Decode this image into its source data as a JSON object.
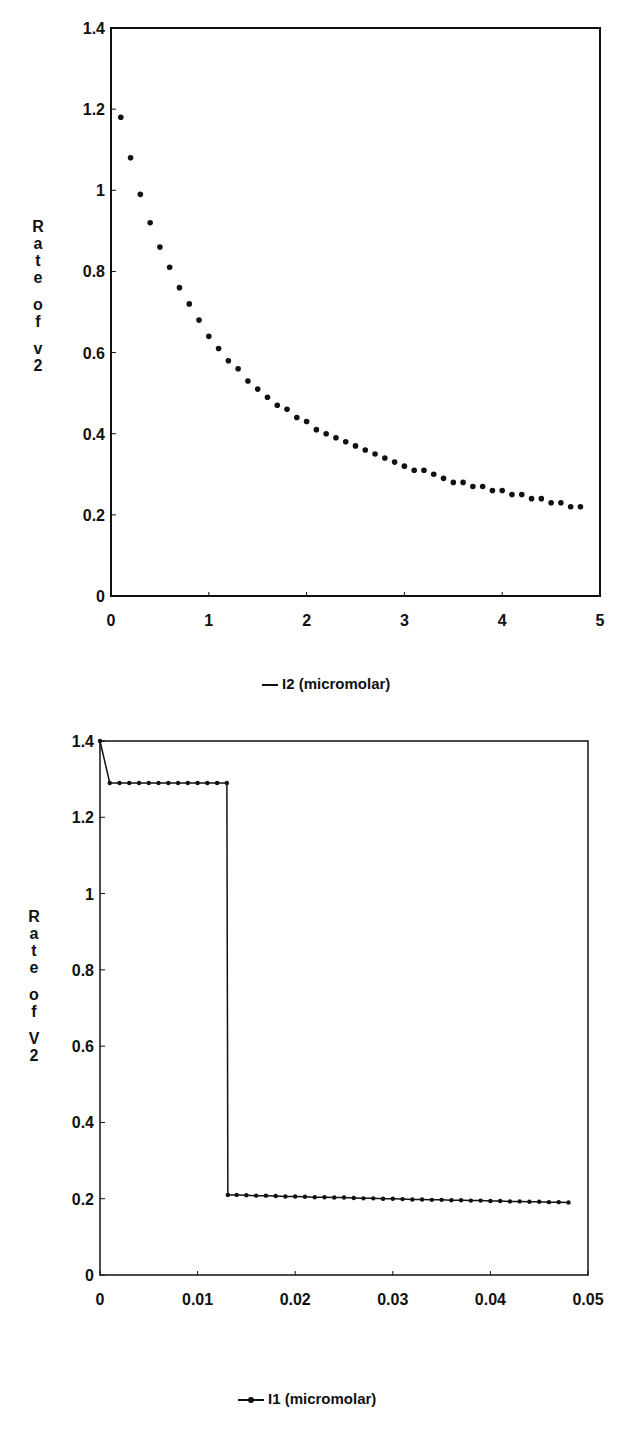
{
  "chart_data": [
    {
      "type": "scatter",
      "title": "",
      "xlabel": "I2 (micromolar)",
      "ylabel": "Rate of v2",
      "xlim": [
        0,
        5
      ],
      "ylim": [
        0,
        1.4
      ],
      "xticks": [
        "0",
        "1",
        "2",
        "3",
        "4",
        "5"
      ],
      "yticks": [
        "0",
        "0.2",
        "0.4",
        "0.6",
        "0.8",
        "1",
        "1.2",
        "1.4"
      ],
      "grid": false,
      "legend": {
        "position": "bottom",
        "entries": [
          "I2 (micromolar)"
        ]
      },
      "series": [
        {
          "name": "I2 (micromolar)",
          "x": [
            0.1,
            0.2,
            0.3,
            0.4,
            0.5,
            0.6,
            0.7,
            0.8,
            0.9,
            1.0,
            1.1,
            1.2,
            1.3,
            1.4,
            1.5,
            1.6,
            1.7,
            1.8,
            1.9,
            2.0,
            2.1,
            2.2,
            2.3,
            2.4,
            2.5,
            2.6,
            2.7,
            2.8,
            2.9,
            3.0,
            3.1,
            3.2,
            3.3,
            3.4,
            3.5,
            3.6,
            3.7,
            3.8,
            3.9,
            4.0,
            4.1,
            4.2,
            4.3,
            4.4,
            4.5,
            4.6,
            4.7,
            4.8
          ],
          "values": [
            1.18,
            1.08,
            0.99,
            0.92,
            0.86,
            0.81,
            0.76,
            0.72,
            0.68,
            0.64,
            0.61,
            0.58,
            0.56,
            0.53,
            0.51,
            0.49,
            0.47,
            0.46,
            0.44,
            0.43,
            0.41,
            0.4,
            0.39,
            0.38,
            0.37,
            0.36,
            0.35,
            0.34,
            0.33,
            0.32,
            0.31,
            0.31,
            0.3,
            0.29,
            0.28,
            0.28,
            0.27,
            0.27,
            0.26,
            0.26,
            0.25,
            0.25,
            0.24,
            0.24,
            0.23,
            0.23,
            0.22,
            0.22
          ]
        }
      ]
    },
    {
      "type": "line",
      "title": "",
      "xlabel": "I1 (micromolar)",
      "ylabel": "Rate of V2",
      "xlim": [
        0,
        0.05
      ],
      "ylim": [
        0,
        1.4
      ],
      "xticks": [
        "0",
        "0.01",
        "0.02",
        "0.03",
        "0.04",
        "0.05"
      ],
      "yticks": [
        "0",
        "0.2",
        "0.4",
        "0.6",
        "0.8",
        "1",
        "1.2",
        "1.4"
      ],
      "grid": false,
      "legend": {
        "position": "bottom",
        "entries": [
          "I1 (micromolar)"
        ]
      },
      "series": [
        {
          "name": "I1 (micromolar)",
          "x": [
            0.0,
            0.001,
            0.002,
            0.003,
            0.004,
            0.005,
            0.006,
            0.007,
            0.008,
            0.009,
            0.01,
            0.011,
            0.012,
            0.013,
            0.0131,
            0.014,
            0.015,
            0.016,
            0.017,
            0.018,
            0.019,
            0.02,
            0.021,
            0.022,
            0.023,
            0.024,
            0.025,
            0.026,
            0.027,
            0.028,
            0.029,
            0.03,
            0.031,
            0.032,
            0.033,
            0.034,
            0.035,
            0.036,
            0.037,
            0.038,
            0.039,
            0.04,
            0.041,
            0.042,
            0.043,
            0.044,
            0.045,
            0.046,
            0.047,
            0.048
          ],
          "values": [
            1.4,
            1.29,
            1.29,
            1.29,
            1.29,
            1.29,
            1.29,
            1.29,
            1.29,
            1.29,
            1.29,
            1.29,
            1.29,
            1.29,
            0.21,
            0.21,
            0.209,
            0.208,
            0.208,
            0.207,
            0.206,
            0.206,
            0.205,
            0.204,
            0.204,
            0.203,
            0.203,
            0.202,
            0.201,
            0.201,
            0.2,
            0.2,
            0.199,
            0.198,
            0.198,
            0.197,
            0.197,
            0.196,
            0.196,
            0.195,
            0.195,
            0.194,
            0.194,
            0.193,
            0.193,
            0.192,
            0.192,
            0.191,
            0.191,
            0.19
          ]
        }
      ]
    }
  ],
  "charts": [
    {
      "ylabel_chars": [
        "R",
        "a",
        "t",
        "e",
        "",
        "o",
        "f",
        "",
        "v",
        "2"
      ],
      "legend_label": "I2 (micromolar)",
      "yticks": [
        "0",
        "0.2",
        "0.4",
        "0.6",
        "0.8",
        "1",
        "1.2",
        "1.4"
      ],
      "xticks": [
        "0",
        "1",
        "2",
        "3",
        "4",
        "5"
      ]
    },
    {
      "ylabel_chars": [
        "R",
        "a",
        "t",
        "e",
        "",
        "o",
        "f",
        "",
        "V",
        "2"
      ],
      "legend_label": "I1 (micromolar)",
      "yticks": [
        "0",
        "0.2",
        "0.4",
        "0.6",
        "0.8",
        "1",
        "1.2",
        "1.4"
      ],
      "xticks": [
        "0",
        "0.01",
        "0.02",
        "0.03",
        "0.04",
        "0.05"
      ]
    }
  ]
}
